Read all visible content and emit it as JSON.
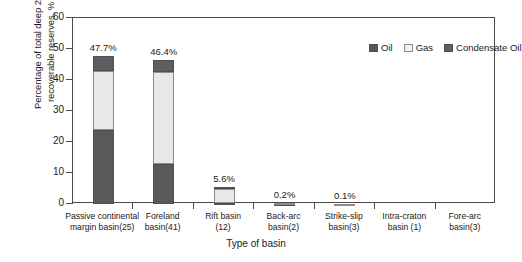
{
  "chart_data": {
    "type": "bar",
    "subtype": "stacked-bar",
    "title": "",
    "xlabel": "Type of basin",
    "ylabel": "Percentage of total deep 2p recoverable reserves, %",
    "ylabel_line1": "Percentage of total deep 2p",
    "ylabel_line2": "recoverable reserves, %",
    "ylim": [
      0,
      60
    ],
    "yticks": [
      0,
      10,
      20,
      30,
      40,
      50,
      60
    ],
    "ytick_labels": [
      "0",
      "10",
      "20",
      "30",
      "40",
      "50",
      "60"
    ],
    "grid": false,
    "legend_position": "top-right-inside",
    "categories": [
      "Passive continental margin basin(25)",
      "Foreland basin(41)",
      "Rift basin (12)",
      "Back-arc basin(2)",
      "Strike-slip basin(3)",
      "Intra-craton basin (1)",
      "Fore-arc basin(3)"
    ],
    "category_lines": [
      [
        "Passive continental",
        "margin  basin(25)"
      ],
      [
        "Foreland",
        "basin(41)"
      ],
      [
        "Rift basin",
        "(12)"
      ],
      [
        "Back-arc",
        "basin(2)"
      ],
      [
        "Strike-slip",
        "basin(3)"
      ],
      [
        "Intra-craton",
        "basin (1)"
      ],
      [
        "Fore-arc",
        "basin(3)"
      ]
    ],
    "series": [
      {
        "name": "Oil",
        "color": "#595959",
        "values": [
          24.0,
          13.0,
          0.3,
          0.1,
          0.05,
          0,
          0
        ]
      },
      {
        "name": "Gas",
        "color": "#e8e8e8",
        "values": [
          19.0,
          29.5,
          4.6,
          0.1,
          0.05,
          0,
          0
        ]
      },
      {
        "name": "Condensate Oil",
        "color": "#5e5e5e",
        "values": [
          4.7,
          3.9,
          0.7,
          0.0,
          0.0,
          0,
          0
        ]
      }
    ],
    "totals": [
      47.7,
      46.4,
      5.6,
      0.2,
      0.1,
      0.0,
      0.0
    ],
    "total_labels": [
      "47.7%",
      "46.4%",
      "5.6%",
      "0.2%",
      "0.1%",
      "",
      ""
    ]
  },
  "legend": {
    "items": [
      {
        "label": "Oil"
      },
      {
        "label": "Gas"
      },
      {
        "label": "Condensate Oil"
      }
    ]
  },
  "colors": {
    "oil": "#595959",
    "gas": "#e8e8e8",
    "condensate": "#5e5e5e",
    "axis": "#4a4a4a",
    "text": "#1a1a1a",
    "background": "#ffffff"
  }
}
